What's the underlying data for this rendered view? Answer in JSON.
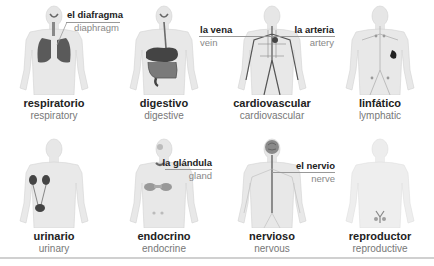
{
  "systems": [
    {
      "id": "respiratory",
      "es": "respiratorio",
      "en": "respiratory",
      "organ": "lungs"
    },
    {
      "id": "digestive",
      "es": "digestivo",
      "en": "digestive",
      "organ": "stomach-intestines"
    },
    {
      "id": "cardiovascular",
      "es": "cardiovascular",
      "en": "cardiovascular",
      "organ": "vessels"
    },
    {
      "id": "lymphatic",
      "es": "linfático",
      "en": "lymphatic",
      "organ": "spleen"
    },
    {
      "id": "urinary",
      "es": "urinario",
      "en": "urinary",
      "organ": "kidneys-bladder"
    },
    {
      "id": "endocrine",
      "es": "endocrino",
      "en": "endocrine",
      "organ": "glands"
    },
    {
      "id": "nervous",
      "es": "nervioso",
      "en": "nervous",
      "organ": "brain-spine"
    },
    {
      "id": "reproductive",
      "es": "reproductor",
      "en": "reproductive",
      "organ": "pelvic-organs"
    }
  ],
  "callouts": {
    "diaphragm": {
      "es": "el diafragma",
      "en": "diaphragm"
    },
    "vein": {
      "es": "la vena",
      "en": "vein"
    },
    "artery": {
      "es": "la arteria",
      "en": "artery"
    },
    "gland": {
      "es": "la glándula",
      "en": "gland"
    },
    "nerve": {
      "es": "el nervio",
      "en": "nerve"
    }
  },
  "colors": {
    "body": "#e8e8e8",
    "body_outline": "#d4d4d4",
    "organ_dark": "#4a4a4a",
    "organ_mid": "#7a7a7a",
    "caption_es": "#222222",
    "caption_en": "#777777",
    "rule": "#999999"
  }
}
